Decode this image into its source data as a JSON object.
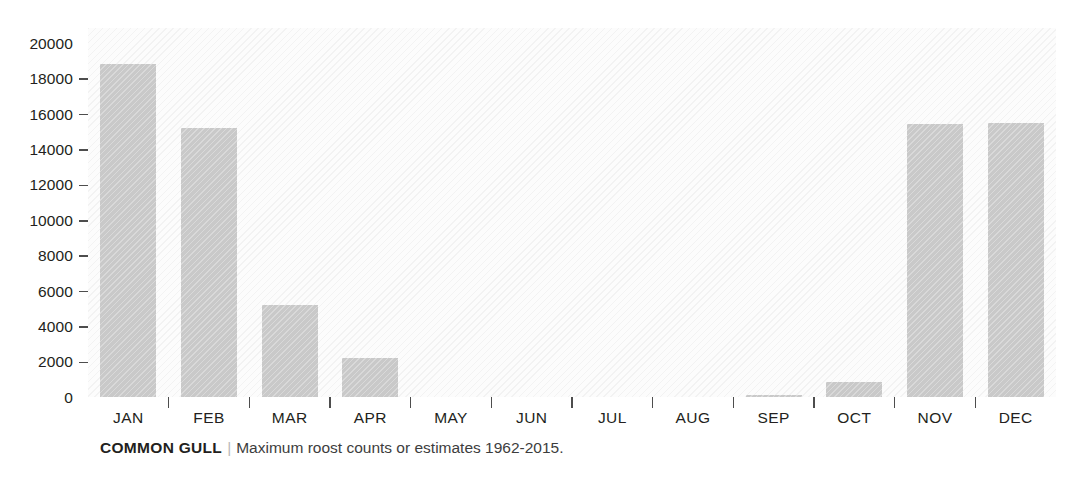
{
  "chart_data": {
    "type": "bar",
    "title": "",
    "subtitle": "",
    "xlabel": "",
    "ylabel": "",
    "categories": [
      "JAN",
      "FEB",
      "MAR",
      "APR",
      "MAY",
      "JUN",
      "JUL",
      "AUG",
      "SEP",
      "OCT",
      "NOV",
      "DEC"
    ],
    "values": [
      18800,
      15200,
      5200,
      2200,
      0,
      0,
      0,
      0,
      100,
      850,
      15450,
      15500
    ],
    "series": [
      {
        "name": "Maximum roost counts or estimates",
        "values": [
          18800,
          15200,
          5200,
          2200,
          0,
          0,
          0,
          0,
          100,
          850,
          15450,
          15500
        ]
      }
    ],
    "ylim": [
      0,
      20000
    ],
    "ytick_values": [
      0,
      2000,
      4000,
      6000,
      8000,
      10000,
      12000,
      14000,
      16000,
      18000,
      20000
    ],
    "ytick_labels": [
      "0",
      "2000",
      "4000",
      "6000",
      "8000",
      "10000",
      "12000",
      "14000",
      "16000",
      "18000",
      "20000"
    ],
    "grid": false,
    "legend": "none",
    "bar_color": "#c9c9c9",
    "axis_text_color": "#231f20",
    "background_color": "#fcfcfc"
  },
  "caption": {
    "species": "COMMON GULL",
    "separator": "|",
    "description": "Maximum roost counts or estimates 1962-2015."
  }
}
